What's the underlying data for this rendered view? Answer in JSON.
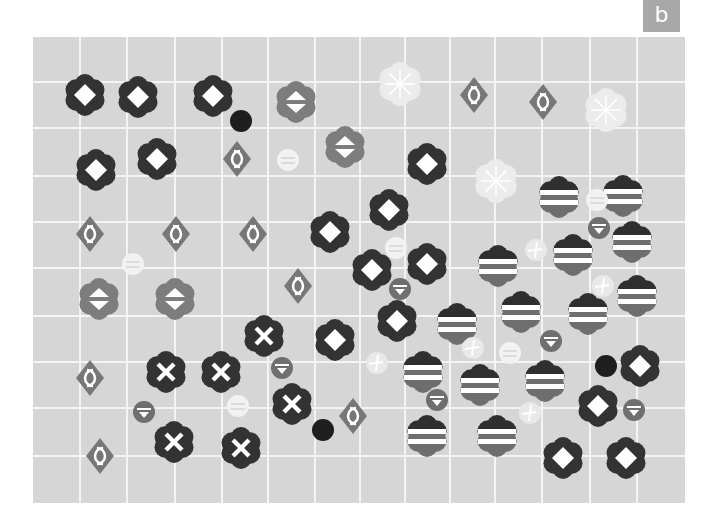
{
  "panel": {
    "label": "b",
    "background": "#d6d6d6",
    "grid_color": "#f4f4f4",
    "area": {
      "x": 33,
      "y": 37,
      "width": 652,
      "height": 466
    },
    "grid_x": [
      80,
      127,
      175,
      222,
      268,
      315,
      360,
      405,
      450,
      495,
      542,
      590,
      637
    ],
    "grid_y": [
      82,
      128,
      176,
      222,
      268,
      316,
      362,
      408,
      456
    ]
  },
  "colors": {
    "dark": "#333333",
    "medium": "#777777",
    "gray_flower": "#7d7d7d",
    "pale": "#efefef",
    "white": "#ffffff"
  },
  "markers": {
    "flower_diamond": [
      [
        85,
        95
      ],
      [
        138,
        97
      ],
      [
        213,
        96
      ],
      [
        96,
        170
      ],
      [
        157,
        159
      ],
      [
        427,
        164
      ],
      [
        389,
        210
      ],
      [
        330,
        232
      ],
      [
        372,
        270
      ],
      [
        427,
        264
      ],
      [
        397,
        321
      ],
      [
        335,
        340
      ],
      [
        640,
        366
      ],
      [
        598,
        406
      ],
      [
        563,
        458
      ],
      [
        626,
        458
      ]
    ],
    "flower_triangles": [
      [
        296,
        102
      ],
      [
        345,
        147
      ],
      [
        99,
        299
      ],
      [
        175,
        299
      ]
    ],
    "diamond_arcs": [
      [
        237,
        159
      ],
      [
        90,
        234
      ],
      [
        176,
        234
      ],
      [
        253,
        234
      ],
      [
        298,
        286
      ],
      [
        90,
        378
      ],
      [
        100,
        456
      ],
      [
        353,
        416
      ],
      [
        474,
        95
      ],
      [
        543,
        102
      ]
    ],
    "flower_x": [
      [
        264,
        336
      ],
      [
        166,
        372
      ],
      [
        221,
        372
      ],
      [
        292,
        404
      ],
      [
        174,
        442
      ],
      [
        241,
        448
      ]
    ],
    "flower_stripes": [
      [
        559,
        197
      ],
      [
        623,
        196
      ],
      [
        632,
        242
      ],
      [
        573,
        255
      ],
      [
        498,
        266
      ],
      [
        637,
        296
      ],
      [
        521,
        312
      ],
      [
        588,
        314
      ],
      [
        457,
        324
      ],
      [
        423,
        372
      ],
      [
        480,
        385
      ],
      [
        545,
        381
      ],
      [
        427,
        436
      ],
      [
        497,
        436
      ]
    ],
    "pale_flower_asterisk": [
      [
        400,
        84
      ],
      [
        606,
        110
      ],
      [
        496,
        181
      ]
    ],
    "dark_circle": [
      [
        241,
        121
      ],
      [
        323,
        430
      ],
      [
        606,
        366
      ]
    ],
    "pale_circle_equals": [
      [
        288,
        160
      ],
      [
        133,
        264
      ],
      [
        396,
        248
      ],
      [
        238,
        406
      ],
      [
        597,
        200
      ],
      [
        510,
        353
      ]
    ],
    "gray_circle_triangle": [
      [
        400,
        289
      ],
      [
        282,
        368
      ],
      [
        144,
        412
      ],
      [
        437,
        400
      ],
      [
        551,
        341
      ],
      [
        634,
        410
      ],
      [
        599,
        228
      ]
    ],
    "pale_circle_cross": [
      [
        377,
        363
      ],
      [
        473,
        348
      ],
      [
        536,
        250
      ],
      [
        603,
        286
      ],
      [
        530,
        413
      ]
    ]
  }
}
